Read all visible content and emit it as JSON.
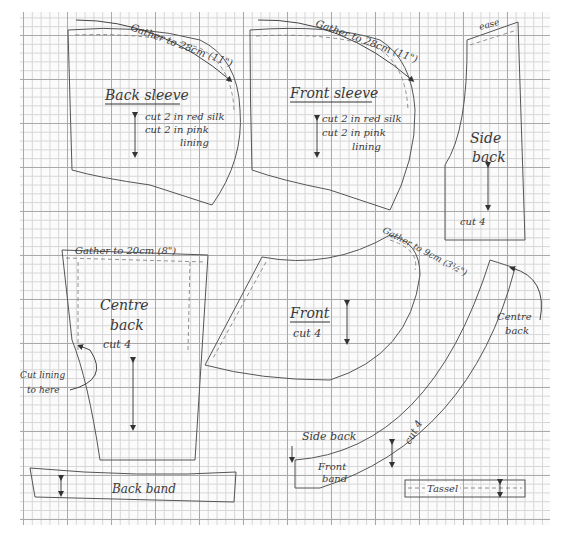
{
  "sheet": {
    "type": "sewing-pattern-on-graph-paper"
  },
  "pieces": {
    "back_sleeve": {
      "title": "Back sleeve",
      "gather_note": "Gather to 28cm (11\")",
      "cut_line1": "cut 2 in red silk",
      "cut_line2": "cut 2 in pink",
      "cut_line3": "lining"
    },
    "front_sleeve": {
      "title": "Front sleeve",
      "gather_note": "Gather to 28cm (11\")",
      "cut_line1": "cut 2 in red silk",
      "cut_line2": "cut 2 in pink",
      "cut_line3": "lining"
    },
    "side_back": {
      "title_line1": "Side",
      "title_line2": "back",
      "top_note": "ease",
      "cut_note": "cut 4"
    },
    "centre_back": {
      "title_line1": "Centre",
      "title_line2": "back",
      "gather_note": "Gather to 20cm (8\")",
      "cut_note": "cut 4",
      "lining_note_line1": "Cut lining",
      "lining_note_line2": "to here"
    },
    "back_band": {
      "title": "Back band"
    },
    "front": {
      "title": "Front",
      "cut_note": "cut 4",
      "gather_note": "Gather to 9cm (3½\")",
      "centre_back_label_line1": "Centre",
      "centre_back_label_line2": "back"
    },
    "front_band": {
      "title_line1": "Front",
      "title_line2": "band",
      "side_back_label": "Side back",
      "cut_note": "cut 4"
    },
    "tassel": {
      "title": "Tassel"
    }
  },
  "colors": {
    "ink": "#3a3a3a",
    "grid_major": "#a9a9a9",
    "grid_minor": "#d6d6d6",
    "paper": "#fbfbfb"
  }
}
